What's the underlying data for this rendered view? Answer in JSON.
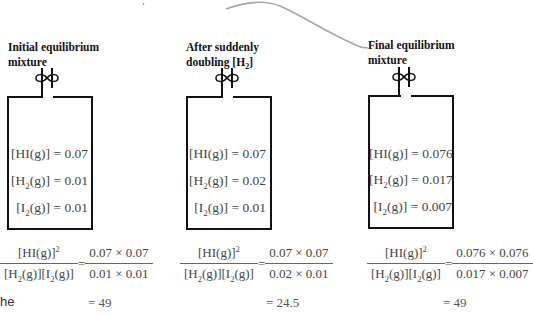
{
  "panels": [
    {
      "title_line1": "Initial equilibrium",
      "title_line2": "mixture",
      "concentrations": [
        {
          "species": "HI(g)",
          "value": "0.07"
        },
        {
          "species": "H2(g)",
          "value": "0.01"
        },
        {
          "species": "I2(g)",
          "value": "0.01"
        }
      ],
      "expression": {
        "numerator": "[HI(g)]²",
        "denominator": "[H₂(g)][I₂(g)]",
        "num_values": "0.07 × 0.07",
        "den_values": "0.01 × 0.01",
        "result": "= 49"
      }
    },
    {
      "title_line1": "After suddenly",
      "title_line2": "doubling [H₂]",
      "concentrations": [
        {
          "species": "HI(g)",
          "value": "0.07"
        },
        {
          "species": "H2(g)",
          "value": "0.02"
        },
        {
          "species": "I2(g)",
          "value": "0.01"
        }
      ],
      "expression": {
        "numerator": "[HI(g)]²",
        "denominator": "[H₂(g)][I₂(g)]",
        "num_values": "0.07 × 0.07",
        "den_values": "0.02 × 0.01",
        "result": "= 24.5"
      }
    },
    {
      "title_line1": "Final equilibrium",
      "title_line2": "mixture",
      "concentrations": [
        {
          "species": "HI(g)",
          "value": "0.076"
        },
        {
          "species": "H2(g)",
          "value": "0.017"
        },
        {
          "species": "I2(g)",
          "value": "0.007"
        }
      ],
      "expression": {
        "numerator": "[HI(g)]²",
        "denominator": "[H₂(g)][I₂(g)]",
        "num_values": "0.076 × 0.076",
        "den_values": "0.017 × 0.007",
        "result": "= 49"
      }
    }
  ],
  "labels": {
    "hi": "[HI(g)] = ",
    "h2_prefix": "[H",
    "i2_prefix": "[I",
    "sub2": "2",
    "gas_suffix": "(g)] = ",
    "equals": "=",
    "stray_text": "he"
  }
}
